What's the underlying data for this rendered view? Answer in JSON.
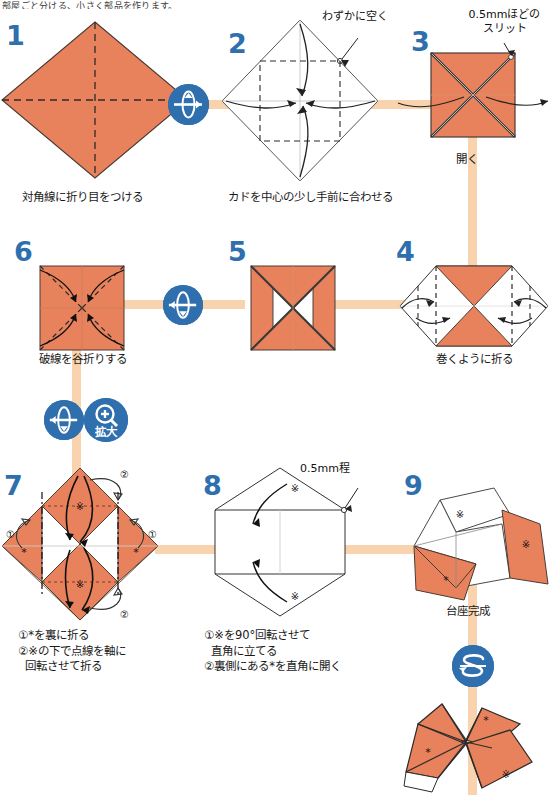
{
  "page": {
    "top_note": "部屋ごと分ける、小さく部品を作ります。",
    "bg_color": "#ffffff",
    "paper_orange": "#e8825c",
    "paper_white": "#ffffff",
    "connector_color": "#f8d3ad",
    "number_color": "#2f6fad",
    "badge_color": "#2f6fad",
    "line_color": "#333333"
  },
  "steps": [
    {
      "id": 1,
      "number": "1",
      "caption": "対角線に折り目をつける",
      "annotations": []
    },
    {
      "id": 2,
      "number": "2",
      "caption": "カドを中心の少し手前に合わせる",
      "annotations": [
        "わずかに空く"
      ]
    },
    {
      "id": 3,
      "number": "3",
      "caption": "開く",
      "annotations": [
        "0.5mmほどの",
        "スリット"
      ]
    },
    {
      "id": 4,
      "number": "4",
      "caption": "巻くように折る",
      "annotations": []
    },
    {
      "id": 5,
      "number": "5",
      "caption": "",
      "annotations": []
    },
    {
      "id": 6,
      "number": "6",
      "caption": "破線を谷折りする",
      "annotations": []
    },
    {
      "id": 7,
      "number": "7",
      "caption": "①*を裏に折る\n②※の下で点線を軸に\n  回転させて折る",
      "marks": [
        "①",
        "②",
        "①",
        "②",
        "※",
        "※",
        "*",
        "*"
      ],
      "annotations": []
    },
    {
      "id": 8,
      "number": "8",
      "caption": "①※を90°回転させて\n  直角に立てる\n②裏側にある*を直角に開く",
      "annotations": [
        "0.5mm程"
      ],
      "marks": [
        "※",
        "※"
      ]
    },
    {
      "id": 9,
      "number": "9",
      "caption": "台座完成",
      "marks": [
        "※",
        "※",
        "*"
      ],
      "annotations": []
    },
    {
      "id": 10,
      "number": "",
      "caption": "",
      "marks": [
        "*",
        "*",
        "※"
      ],
      "annotations": []
    }
  ],
  "badges": [
    {
      "id": "flip-1-2",
      "icon": "flip-over-icon",
      "label": ""
    },
    {
      "id": "flip-5-6",
      "icon": "flip-over-icon",
      "label": ""
    },
    {
      "id": "flip-6-7",
      "icon": "flip-over-icon",
      "label": ""
    },
    {
      "id": "zoom-6-7",
      "icon": "magnify-icon",
      "label": "拡大"
    },
    {
      "id": "rotate-9-10",
      "icon": "rotate-icon",
      "label": ""
    }
  ]
}
